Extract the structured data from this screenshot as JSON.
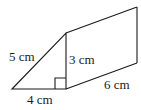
{
  "diagram": {
    "type": "triangular-prism",
    "labels": {
      "hypotenuse": "5 cm",
      "height": "3 cm",
      "base": "4 cm",
      "length": "6 cm"
    },
    "colors": {
      "stroke": "#1a1a1a",
      "background": "#ffffff"
    }
  }
}
